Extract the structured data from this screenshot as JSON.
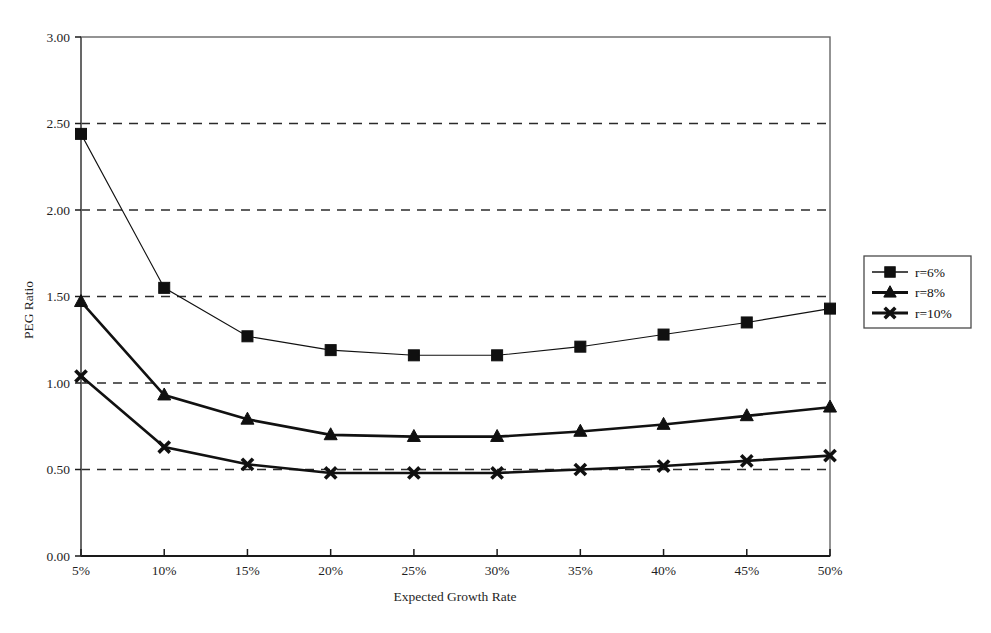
{
  "chart_data": {
    "type": "line",
    "title": "",
    "xlabel": "Expected Growth Rate",
    "ylabel": "PEG Ratio",
    "categories": [
      "5%",
      "10%",
      "15%",
      "20%",
      "25%",
      "30%",
      "35%",
      "40%",
      "45%",
      "50%"
    ],
    "x_tick_labels": [
      "5%",
      "10%",
      "15%",
      "20%",
      "25%",
      "30%",
      "35%",
      "40%",
      "45%",
      "50%"
    ],
    "y_tick_labels": [
      "0.00",
      "0.50",
      "1.00",
      "1.50",
      "2.00",
      "2.50",
      "3.00"
    ],
    "y_tick_values": [
      0.0,
      0.5,
      1.0,
      1.5,
      2.0,
      2.5,
      3.0
    ],
    "ylim": [
      0.0,
      3.0
    ],
    "grid": "horizontal-dashed",
    "legend_position": "right-outside",
    "series": [
      {
        "name": "r=6%",
        "marker": "square",
        "values": [
          2.44,
          1.55,
          1.27,
          1.19,
          1.16,
          1.16,
          1.21,
          1.28,
          1.35,
          1.43
        ]
      },
      {
        "name": "r=8%",
        "marker": "triangle",
        "values": [
          1.47,
          0.93,
          0.79,
          0.7,
          0.69,
          0.69,
          0.72,
          0.76,
          0.81,
          0.86
        ]
      },
      {
        "name": "r=10%",
        "marker": "cross",
        "values": [
          1.04,
          0.63,
          0.53,
          0.48,
          0.48,
          0.48,
          0.5,
          0.52,
          0.55,
          0.58
        ]
      }
    ]
  },
  "legend": {
    "entries": [
      {
        "label": "r=6%",
        "marker": "square"
      },
      {
        "label": "r=8%",
        "marker": "triangle"
      },
      {
        "label": "r=10%",
        "marker": "cross"
      }
    ]
  },
  "axes": {
    "y_title": "PEG Ratio",
    "x_title": "Expected Growth Rate"
  },
  "colors": {
    "line": "#111111",
    "frame": "#666666",
    "grid": "#2b2b2b",
    "background": "#ffffff"
  }
}
